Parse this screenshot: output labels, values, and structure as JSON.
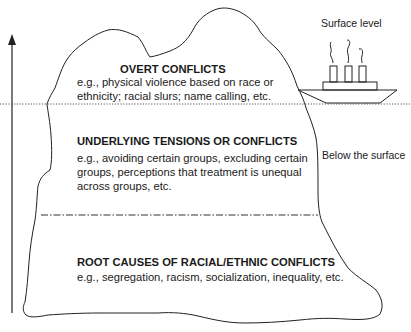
{
  "diagram": {
    "type": "iceberg",
    "labels": {
      "surface_level": "Surface level",
      "below_surface": "Below the surface"
    },
    "sections": [
      {
        "id": "overt",
        "title": "OVERT CONFLICTS",
        "lines": [
          "e.g., physical violence based on race or",
          "ethnicity; racial slurs; name calling, etc."
        ]
      },
      {
        "id": "underlying",
        "title": "UNDERLYING TENSIONS OR CONFLICTS",
        "lines": [
          "e.g., avoiding certain groups, excluding certain",
          "groups, perceptions that treatment is unequal",
          "across groups, etc."
        ]
      },
      {
        "id": "root",
        "title": "ROOT CAUSES OF RACIAL/ETHNIC CONFLICTS",
        "lines": [
          "e.g., segregation, racism, socialization, inequality, etc."
        ]
      }
    ],
    "colors": {
      "line": "#222222",
      "background": "#ffffff"
    }
  }
}
